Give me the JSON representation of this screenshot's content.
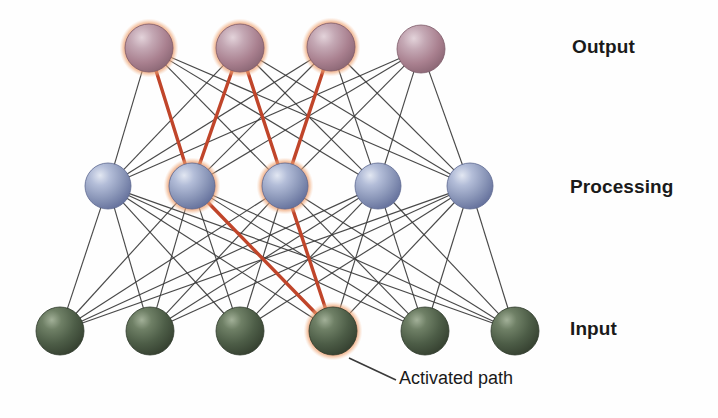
{
  "figure": {
    "background_color": "#fefefe"
  },
  "labels": {
    "output": "Output",
    "processing": "Processing",
    "input": "Input",
    "activated_path": "Activated path"
  },
  "colors": {
    "output_node": "#a9808f",
    "output_node_light": "#d8c2cb",
    "output_node_dark": "#8d6a79",
    "processing_node": "#8a96b8",
    "processing_node_light": "#cfd6e8",
    "processing_node_dark": "#6a78a0",
    "input_node": "#4a5a45",
    "input_node_light": "#8fa086",
    "input_node_dark": "#35422f",
    "halo": "#e4743f",
    "halo_outer": "#f0a878",
    "edge": "#3a3a3a",
    "active_edge": "#c0452a",
    "label_text": "#1a1a1a",
    "leader_line": "#3a3a3a"
  },
  "chart_data": {
    "type": "diagram",
    "layers": [
      {
        "id": "output",
        "label": "Output",
        "node_count": 4,
        "y": 48,
        "radius": 24,
        "color": "#a9808f",
        "nodes": [
          {
            "index": 0,
            "x": 149,
            "y": 48,
            "activated": true
          },
          {
            "index": 1,
            "x": 240,
            "y": 48,
            "activated": true
          },
          {
            "index": 2,
            "x": 331,
            "y": 47,
            "activated": true
          },
          {
            "index": 3,
            "x": 421,
            "y": 49,
            "activated": false
          }
        ]
      },
      {
        "id": "processing",
        "label": "Processing",
        "node_count": 5,
        "y": 186,
        "radius": 23,
        "color": "#8a96b8",
        "nodes": [
          {
            "index": 0,
            "x": 108,
            "y": 186,
            "activated": false
          },
          {
            "index": 1,
            "x": 192,
            "y": 186,
            "activated": true
          },
          {
            "index": 2,
            "x": 285,
            "y": 186,
            "activated": true
          },
          {
            "index": 3,
            "x": 378,
            "y": 186,
            "activated": false
          },
          {
            "index": 4,
            "x": 470,
            "y": 186,
            "activated": false
          }
        ]
      },
      {
        "id": "input",
        "label": "Input",
        "node_count": 6,
        "y": 331,
        "radius": 24,
        "color": "#4a5a45",
        "nodes": [
          {
            "index": 0,
            "x": 60,
            "y": 331,
            "activated": false
          },
          {
            "index": 1,
            "x": 150,
            "y": 331,
            "activated": false
          },
          {
            "index": 2,
            "x": 240,
            "y": 331,
            "activated": false
          },
          {
            "index": 3,
            "x": 333,
            "y": 331,
            "activated": true
          },
          {
            "index": 4,
            "x": 425,
            "y": 331,
            "activated": false
          },
          {
            "index": 5,
            "x": 515,
            "y": 331,
            "activated": false
          }
        ]
      }
    ],
    "active_edges": [
      {
        "from_layer": "input",
        "from_index": 3,
        "to_layer": "processing",
        "to_index": 1
      },
      {
        "from_layer": "input",
        "from_index": 3,
        "to_layer": "processing",
        "to_index": 2
      },
      {
        "from_layer": "processing",
        "from_index": 1,
        "to_layer": "output",
        "to_index": 0
      },
      {
        "from_layer": "processing",
        "from_index": 1,
        "to_layer": "output",
        "to_index": 1
      },
      {
        "from_layer": "processing",
        "from_index": 2,
        "to_layer": "output",
        "to_index": 1
      },
      {
        "from_layer": "processing",
        "from_index": 2,
        "to_layer": "output",
        "to_index": 2
      }
    ],
    "annotation": {
      "text": "Activated path",
      "points_to_layer": "input",
      "points_to_index": 3,
      "leader_from": [
        349,
        358
      ],
      "leader_to": [
        396,
        380
      ]
    },
    "connectivity": "fully-connected between adjacent layers"
  }
}
